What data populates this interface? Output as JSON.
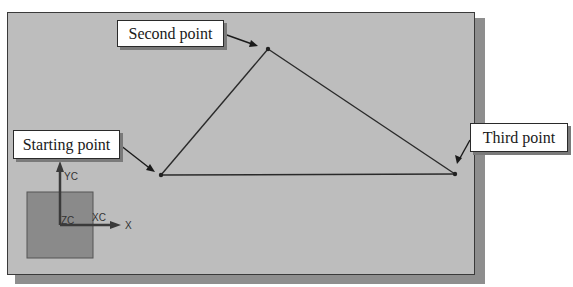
{
  "figure": {
    "callouts": {
      "starting": "Starting point",
      "second": "Second point",
      "third": "Third point"
    },
    "triad": {
      "y_label": "YC",
      "x_label": "XC",
      "z_label": "ZC",
      "world_x_label": "X"
    },
    "points": [
      {
        "name": "Starting point",
        "x": 161,
        "y": 175
      },
      {
        "name": "Second point",
        "x": 268,
        "y": 49
      },
      {
        "name": "Third point",
        "x": 455,
        "y": 174
      }
    ],
    "colors": {
      "background": "#bdbdbd",
      "line": "#2a2a2a",
      "triad_square": "#8a8a8a"
    }
  }
}
